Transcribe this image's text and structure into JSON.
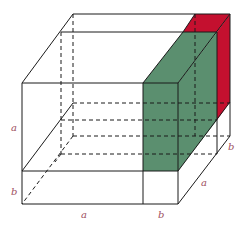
{
  "diagram": {
    "colors": {
      "green_slab": "#5b8f6f",
      "red_slab": "#c4102f",
      "lines": "#1a1a1a",
      "labels": "#a0505f"
    },
    "labels": {
      "left_a": "a",
      "left_b": "b",
      "bottom_a": "a",
      "bottom_b": "b",
      "depth_a": "a",
      "depth_b": "b"
    }
  }
}
